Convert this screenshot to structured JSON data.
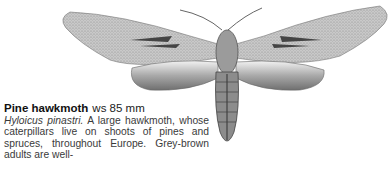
{
  "entry": {
    "common_name": "Pine hawkmoth",
    "wingspan": "ws 85 mm",
    "latin_name": "Hyloicus pinastri.",
    "description": " A large hawkmoth, whose caterpillars live on shoots of pines and spruces, throughout Europe. Grey-brown adults are well-"
  },
  "illustration": {
    "subject": "pine-hawkmoth",
    "colors": {
      "wing": "#b8b8b8",
      "dark": "#555555",
      "body": "#8a8a8a"
    }
  }
}
